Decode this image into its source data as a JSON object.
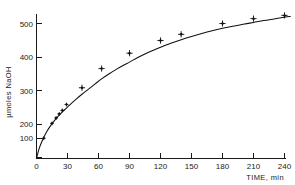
{
  "chart_data": {
    "type": "line",
    "title": "",
    "subtitle": "",
    "xlabel": "TIME, min",
    "ylabel": "µmoles NaOH",
    "xlim": [
      0,
      248
    ],
    "ylim": [
      0,
      545
    ],
    "grid": false,
    "legend": null,
    "marker_style": "plus-with-dot",
    "xticks": [
      0,
      30,
      60,
      90,
      120,
      150,
      180,
      210,
      240
    ],
    "xticklabels": [
      "0",
      "30",
      "60",
      "90",
      "120",
      "150",
      "180",
      "210",
      "240"
    ],
    "yticks": [
      100,
      200,
      300,
      400,
      500
    ],
    "yticklabels": [
      "100",
      "200",
      "300",
      "400",
      "500"
    ],
    "series": [
      {
        "name": "NaOH released",
        "x": [
          7,
          15,
          19,
          22,
          25,
          29,
          44,
          63,
          90,
          120,
          140,
          180,
          210,
          240
        ],
        "values": [
          75,
          130,
          150,
          165,
          178,
          200,
          262,
          333,
          390,
          437,
          460,
          500,
          518,
          530
        ]
      }
    ],
    "curve_points": [
      [
        0,
        0
      ],
      [
        2,
        30
      ],
      [
        4,
        52
      ],
      [
        7,
        78
      ],
      [
        10,
        100
      ],
      [
        13,
        118
      ],
      [
        16,
        134
      ],
      [
        19,
        148
      ],
      [
        22,
        161
      ],
      [
        25,
        173
      ],
      [
        29,
        187
      ],
      [
        34,
        205
      ],
      [
        39,
        222
      ],
      [
        44,
        238
      ],
      [
        50,
        256
      ],
      [
        57,
        277
      ],
      [
        63,
        295
      ],
      [
        70,
        313
      ],
      [
        78,
        332
      ],
      [
        85,
        347
      ],
      [
        90,
        357
      ],
      [
        98,
        374
      ],
      [
        107,
        391
      ],
      [
        115,
        404
      ],
      [
        120,
        412
      ],
      [
        130,
        427
      ],
      [
        140,
        440
      ],
      [
        150,
        452
      ],
      [
        160,
        463
      ],
      [
        170,
        473
      ],
      [
        180,
        482
      ],
      [
        190,
        490
      ],
      [
        200,
        497
      ],
      [
        210,
        504
      ],
      [
        220,
        511
      ],
      [
        230,
        517
      ],
      [
        240,
        523
      ],
      [
        246,
        526
      ]
    ]
  },
  "axis": {
    "x_title": "TIME, min",
    "y_title": "µmoles NaOH"
  }
}
